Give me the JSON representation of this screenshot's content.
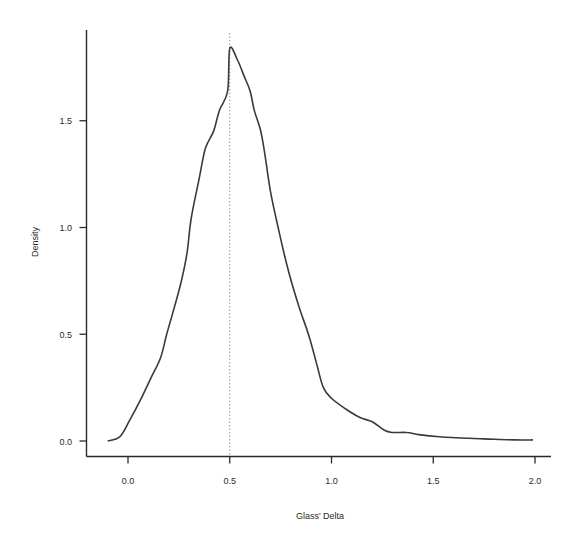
{
  "chart_data": {
    "type": "line",
    "title": "",
    "xlabel": "Glass' Delta",
    "ylabel": "Density",
    "xlim": [
      -0.1,
      2.1
    ],
    "ylim": [
      0.0,
      1.92
    ],
    "x_ticks": [
      0.0,
      0.5,
      1.0,
      1.5,
      2.0
    ],
    "x_tick_labels": [
      "0.0",
      "0.5",
      "1.0",
      "1.5",
      "2.0"
    ],
    "y_ticks": [
      0.0,
      0.5,
      1.0,
      1.5
    ],
    "y_tick_labels": [
      "0.0",
      "0.5",
      "1.0",
      "1.5"
    ],
    "grid": false,
    "legend": null,
    "reference_line": {
      "orientation": "vertical",
      "x": 0.5,
      "style": "dotted"
    },
    "series": [
      {
        "name": "density",
        "x": [
          -0.1,
          -0.04,
          0.01,
          0.06,
          0.11,
          0.16,
          0.19,
          0.22,
          0.26,
          0.29,
          0.31,
          0.35,
          0.38,
          0.42,
          0.45,
          0.49,
          0.5,
          0.54,
          0.57,
          0.6,
          0.62,
          0.65,
          0.67,
          0.7,
          0.74,
          0.79,
          0.84,
          0.89,
          0.93,
          0.96,
          1.0,
          1.07,
          1.14,
          1.2,
          1.26,
          1.3,
          1.37,
          1.43,
          1.53,
          1.62,
          1.75,
          1.9,
          1.99
        ],
        "y": [
          0.0,
          0.02,
          0.1,
          0.19,
          0.29,
          0.39,
          0.5,
          0.6,
          0.74,
          0.88,
          1.04,
          1.23,
          1.37,
          1.45,
          1.55,
          1.64,
          1.84,
          1.78,
          1.71,
          1.64,
          1.55,
          1.46,
          1.36,
          1.17,
          0.99,
          0.79,
          0.63,
          0.49,
          0.35,
          0.25,
          0.2,
          0.15,
          0.11,
          0.09,
          0.05,
          0.04,
          0.04,
          0.03,
          0.02,
          0.015,
          0.01,
          0.005,
          0.005
        ]
      }
    ]
  },
  "colors": {
    "background": "#ffffff",
    "axis": "#2a2a2a",
    "curve": "#3a3a3a",
    "reference_line": "#8a8a8a"
  }
}
